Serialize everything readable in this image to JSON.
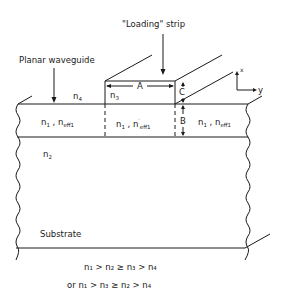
{
  "diagram": {
    "labels": {
      "loading_strip": "\"Loading\" strip",
      "planar_waveguide": "Planar waveguide",
      "n4": "n",
      "n4_sub": "4",
      "n3": "n",
      "n3_sub": "3",
      "n2": "n",
      "n2_sub": "2",
      "dim_a": "A",
      "dim_b": "B",
      "dim_c": "C",
      "axis_x": "x",
      "axis_y": "y",
      "substrate": "Substrate",
      "left_region": "n₁ , n_eff1",
      "center_region": "n₁ , n′_eff1",
      "right_region": "n₁ , n_eff1"
    },
    "regions": {
      "left": {
        "n": "n",
        "n_sub": "1",
        "sep": " , ",
        "neff": "n",
        "neff_sub": "eff1",
        "prime": ""
      },
      "center": {
        "n": "n",
        "n_sub": "1",
        "sep": " , ",
        "neff": "n",
        "neff_sub": "eff1",
        "prime": "′"
      },
      "right": {
        "n": "n",
        "n_sub": "1",
        "sep": " , ",
        "neff": "n",
        "neff_sub": "eff1",
        "prime": ""
      }
    },
    "conditions": [
      "n₁ > n₂ ≥ n₃ > n₄",
      "or  n₁ > n₃ ≥ n₂ > n₄"
    ]
  }
}
